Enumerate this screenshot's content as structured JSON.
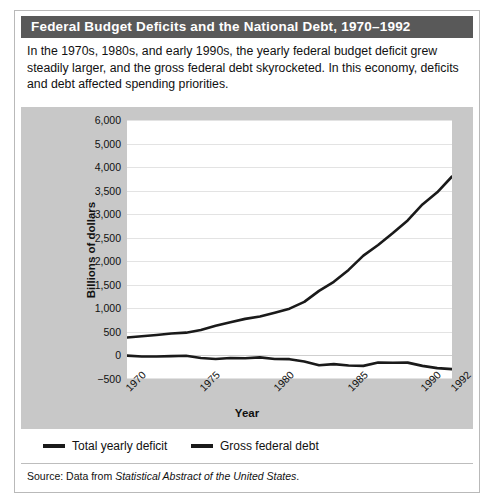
{
  "figure": {
    "title": "Federal Budget Deficits and the National Debt, 1970–1992",
    "description": "In the 1970s, 1980s, and early 1990s, the yearly federal budget deficit grew steadily larger, and the gross federal debt skyrocketed. In this economy, deficits and debt affected spending priorities.",
    "source_prefix": "Source: Data from ",
    "source_title": "Statistical Abstract of the United States",
    "source_suffix": ".",
    "title_bar_color": "#595959",
    "panel_color": "#c8c8c8",
    "plot_color": "#ffffff",
    "line_color": "#1a1a1a"
  },
  "chart_data": {
    "type": "line",
    "title": "Federal Budget Deficits and the National Debt, 1970–1992",
    "xlabel": "Year",
    "ylabel": "Billions of dollars",
    "grid": true,
    "legend_position": "bottom",
    "xlim": [
      1970,
      1992
    ],
    "xticks": [
      1970,
      1975,
      1980,
      1985,
      1990,
      1992
    ],
    "ytick_labels": [
      "6,000",
      "5,000",
      "4,000",
      "3,500",
      "3,000",
      "2,500",
      "2,000",
      "1,500",
      "1,000",
      "500",
      "0",
      "−500"
    ],
    "ytick_values": [
      6000,
      5000,
      4000,
      3500,
      3000,
      2500,
      2000,
      1500,
      1000,
      500,
      0,
      -500
    ],
    "ytick_note": "Axis labels are unevenly scaled as printed: evenly spaced gridlines carry the values 6,000; 5,000; 4,000; 3,500; 3,000; 2,500; 2,000; 1,500; 1,000; 500; 0; -500.",
    "x": [
      1970,
      1971,
      1972,
      1973,
      1974,
      1975,
      1976,
      1977,
      1978,
      1979,
      1980,
      1981,
      1982,
      1983,
      1984,
      1985,
      1986,
      1987,
      1988,
      1989,
      1990,
      1991,
      1992
    ],
    "series": [
      {
        "name": "Total yearly deficit",
        "values": [
          -3,
          -23,
          -23,
          -15,
          -6,
          -53,
          -74,
          -54,
          -59,
          -41,
          -74,
          -79,
          -128,
          -208,
          -185,
          -212,
          -221,
          -150,
          -155,
          -152,
          -221,
          -269,
          -290
        ]
      },
      {
        "name": "Gross federal debt",
        "values": [
          381,
          408,
          436,
          466,
          484,
          541,
          629,
          706,
          777,
          829,
          909,
          994,
          1137,
          1371,
          1564,
          1817,
          2120,
          2346,
          2601,
          2868,
          3206,
          3465,
          3800
        ]
      }
    ]
  },
  "legend": [
    {
      "label": "Total yearly deficit"
    },
    {
      "label": "Gross federal debt"
    }
  ]
}
